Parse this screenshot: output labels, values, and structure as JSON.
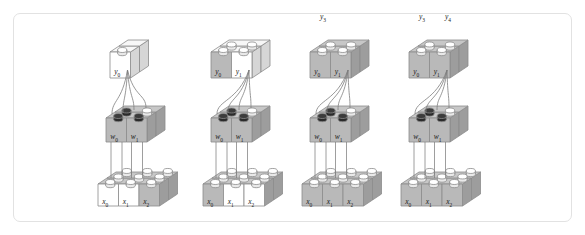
{
  "figure": {
    "kind": "lego-brick-diagram",
    "border_color": "#e2e2e2",
    "background": "#ffffff",
    "brick_white": "#ffffff",
    "brick_grey": "#b9b9b9",
    "stud_dark": "#3a3a3a",
    "wire_color": "#7d7d7d"
  },
  "groups": [
    {
      "id": "group-1",
      "top_labels": [],
      "output_bricks": [
        {
          "label": "y",
          "sub": "0",
          "shade": "white"
        }
      ],
      "weight_bricks": [
        {
          "label": "w",
          "sub": "0",
          "shade": "grey"
        },
        {
          "label": "w",
          "sub": "1",
          "shade": "grey"
        }
      ],
      "input_bricks": [
        {
          "label": "x",
          "sub": "0",
          "shade": "white"
        },
        {
          "label": "x",
          "sub": "1",
          "shade": "white"
        },
        {
          "label": "x",
          "sub": "2",
          "shade": "grey"
        }
      ],
      "active_studs": 3,
      "wire_count": 4
    },
    {
      "id": "group-2",
      "top_labels": [],
      "output_bricks": [
        {
          "label": "y",
          "sub": "0",
          "shade": "grey"
        },
        {
          "label": "y",
          "sub": "1",
          "shade": "white"
        }
      ],
      "weight_bricks": [
        {
          "label": "w",
          "sub": "0",
          "shade": "grey"
        },
        {
          "label": "w",
          "sub": "1",
          "shade": "grey"
        }
      ],
      "input_bricks": [
        {
          "label": "x",
          "sub": "0",
          "shade": "grey"
        },
        {
          "label": "x",
          "sub": "1",
          "shade": "white"
        },
        {
          "label": "x",
          "sub": "2",
          "shade": "white"
        }
      ],
      "active_studs": 3,
      "wire_count": 4
    },
    {
      "id": "group-3",
      "top_labels": [
        {
          "label": "y",
          "sub": "3"
        }
      ],
      "output_bricks": [
        {
          "label": "y",
          "sub": "0",
          "shade": "grey"
        },
        {
          "label": "y",
          "sub": "1",
          "shade": "grey"
        }
      ],
      "weight_bricks": [
        {
          "label": "w",
          "sub": "0",
          "shade": "grey"
        },
        {
          "label": "w",
          "sub": "1",
          "shade": "grey"
        }
      ],
      "input_bricks": [
        {
          "label": "x",
          "sub": "0",
          "shade": "grey"
        },
        {
          "label": "x",
          "sub": "1",
          "shade": "grey"
        },
        {
          "label": "x",
          "sub": "2",
          "shade": "grey"
        }
      ],
      "active_studs": 3,
      "wire_count": 4
    },
    {
      "id": "group-4",
      "top_labels": [
        {
          "label": "y",
          "sub": "3"
        },
        {
          "label": "y",
          "sub": "4"
        }
      ],
      "output_bricks": [
        {
          "label": "y",
          "sub": "0",
          "shade": "grey"
        },
        {
          "label": "y",
          "sub": "1",
          "shade": "grey"
        }
      ],
      "weight_bricks": [
        {
          "label": "w",
          "sub": "0",
          "shade": "grey"
        },
        {
          "label": "w",
          "sub": "1",
          "shade": "grey"
        }
      ],
      "input_bricks": [
        {
          "label": "x",
          "sub": "0",
          "shade": "grey"
        },
        {
          "label": "x",
          "sub": "1",
          "shade": "grey"
        },
        {
          "label": "x",
          "sub": "2",
          "shade": "grey"
        }
      ],
      "active_studs": 3,
      "wire_count": 4
    }
  ]
}
